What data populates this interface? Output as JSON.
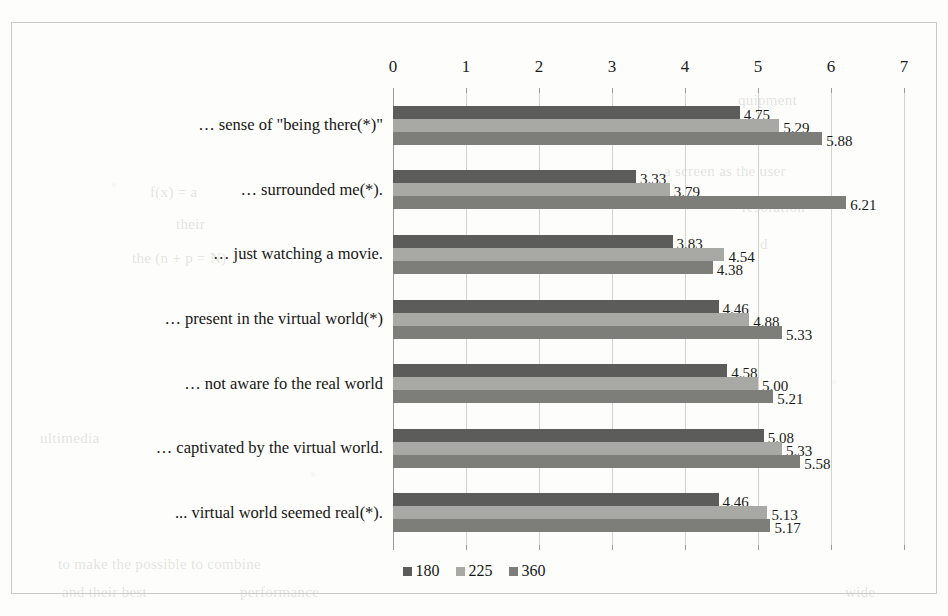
{
  "chart_data": {
    "type": "bar",
    "orientation": "horizontal",
    "title": "",
    "xlabel": "",
    "ylabel": "",
    "xlim": [
      0,
      7
    ],
    "xticks": [
      0,
      1,
      2,
      3,
      4,
      5,
      6,
      7
    ],
    "xtick_labels": [
      "0",
      "1",
      "2",
      "3",
      "4",
      "5",
      "6",
      "7"
    ],
    "grid": true,
    "legend_position": "bottom",
    "categories": [
      "… sense of \"being there(*)\"",
      "… surrounded me(*).",
      "… just watching a movie.",
      "… present in the virtual world(*)",
      "… not aware fo the real world",
      "… captivated by the virtual world.",
      "... virtual world seemed real(*)."
    ],
    "series": [
      {
        "name": "180",
        "color": "#5c5c5a",
        "values": [
          4.75,
          3.33,
          3.83,
          4.46,
          4.58,
          5.08,
          4.46
        ],
        "labels": [
          "4.75",
          "3.33",
          "3.83",
          "4.46",
          "4.58",
          "5.08",
          "4.46"
        ]
      },
      {
        "name": "225",
        "color": "#a8a8a4",
        "values": [
          5.29,
          3.79,
          4.54,
          4.88,
          5.0,
          5.33,
          5.13
        ],
        "labels": [
          "5.29",
          "3.79",
          "4.54",
          "4.88",
          "5.00",
          "5.33",
          "5.13"
        ]
      },
      {
        "name": "360",
        "color": "#7d7d79",
        "values": [
          5.88,
          6.21,
          4.38,
          5.33,
          5.21,
          5.58,
          5.17
        ],
        "labels": [
          "5.88",
          "6.21",
          "4.38",
          "5.33",
          "5.21",
          "5.58",
          "5.17"
        ]
      }
    ]
  },
  "legend": {
    "items": [
      {
        "label": "180",
        "color": "#5c5c5a"
      },
      {
        "label": "225",
        "color": "#a8a8a4"
      },
      {
        "label": "360",
        "color": "#7d7d79"
      }
    ]
  },
  "background_text": [
    {
      "text": "quipment",
      "x": 738,
      "y": 92
    },
    {
      "text": "xperiment was",
      "x": 700,
      "y": 128
    },
    {
      "text": "a screen as the user",
      "x": 664,
      "y": 163
    },
    {
      "text": "resolution",
      "x": 742,
      "y": 199
    },
    {
      "text": "d",
      "x": 760,
      "y": 236
    },
    {
      "text": "f(x) = a",
      "x": 150,
      "y": 184
    },
    {
      "text": "their",
      "x": 176,
      "y": 216
    },
    {
      "text": "the (n + p = N)",
      "x": 132,
      "y": 250
    },
    {
      "text": "ultimedia",
      "x": 40,
      "y": 430
    },
    {
      "text": "to make the possible to combine",
      "x": 58,
      "y": 556
    },
    {
      "text": "and their best",
      "x": 62,
      "y": 584
    },
    {
      "text": "performance",
      "x": 240,
      "y": 584
    },
    {
      "text": "wide",
      "x": 845,
      "y": 584
    }
  ]
}
